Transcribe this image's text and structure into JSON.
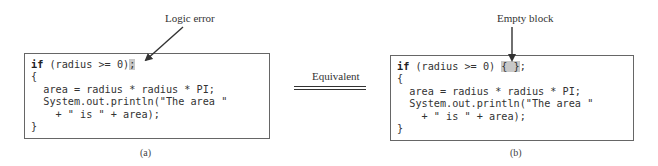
{
  "panel_a": {
    "annotation": "Logic error",
    "code_lines": [
      {
        "pre": "if",
        "mid": " (radius >= 0)",
        "hl": ";",
        "post": ""
      },
      {
        "text": "{"
      },
      {
        "text": "  area = radius * radius * PI;"
      },
      {
        "text": "  System.out.println(\"The area \""
      },
      {
        "text": "    + \" is \" + area);"
      },
      {
        "text": "}"
      }
    ],
    "caption": "(a)"
  },
  "middle": {
    "label": "Equivalent"
  },
  "panel_b": {
    "annotation": "Empty block",
    "code_lines": [
      {
        "pre": "if",
        "mid": " (radius >= 0) ",
        "hl": "{ }",
        "post": ";"
      },
      {
        "text": "{"
      },
      {
        "text": "  area = radius * radius * PI;"
      },
      {
        "text": "  System.out.println(\"The area \""
      },
      {
        "text": "    + \" is \" + area);"
      },
      {
        "text": "}"
      }
    ],
    "caption": "(b)"
  },
  "colors": {
    "highlight": "#c8c8c8",
    "border": "#666666",
    "text": "#333333"
  }
}
